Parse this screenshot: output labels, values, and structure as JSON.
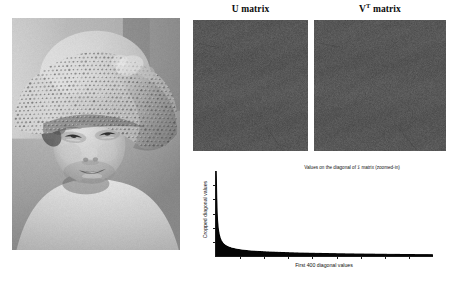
{
  "figure": {
    "caption_absent": true,
    "background_color": "#ffffff"
  },
  "photo": {
    "name": "original-grayscale-photo",
    "description": "Grayscale photograph of a young smiling child wearing a wide-brimmed crochet straw hat",
    "colorspace": "grayscale",
    "frame_color": "#ffffff"
  },
  "panels": {
    "u_matrix": {
      "title": "U matrix",
      "title_plain": "U matrix",
      "fill_description": "uniform gray noise",
      "mean_gray": "#565656",
      "noise_amplitude": 14
    },
    "vt_matrix": {
      "title_base": "V",
      "title_superscript": "T",
      "title_suffix": " matrix",
      "title_plain": "V^T matrix",
      "fill_description": "uniform gray noise",
      "mean_gray": "#565656",
      "noise_amplitude": 14
    }
  },
  "chart_data": {
    "type": "area",
    "title": "Values on the diagonal of Σ matrix (zoomed-in)",
    "xlabel": "First 400 diagonal values",
    "ylabel": "Cropped diagonal values",
    "grid": false,
    "legend": null,
    "fill_color": "#050505",
    "line_color": "#000000",
    "axis_color": "#1a1a1a",
    "xlim": [
      0,
      400
    ],
    "ylim": [
      0,
      1
    ],
    "x_tick_count": 8,
    "y_tick_count": 5,
    "x_tick_labels": [],
    "y_tick_labels": [],
    "x": [
      1,
      2,
      3,
      4,
      5,
      6,
      8,
      10,
      12,
      15,
      20,
      25,
      30,
      40,
      50,
      60,
      80,
      100,
      125,
      150,
      175,
      200,
      225,
      250,
      275,
      300,
      325,
      350,
      375,
      400
    ],
    "values": [
      1.0,
      0.62,
      0.45,
      0.36,
      0.305,
      0.265,
      0.215,
      0.183,
      0.162,
      0.14,
      0.118,
      0.104,
      0.094,
      0.08,
      0.071,
      0.064,
      0.055,
      0.049,
      0.043,
      0.0385,
      0.0348,
      0.0318,
      0.0292,
      0.027,
      0.025,
      0.0232,
      0.0216,
      0.0202,
      0.0189,
      0.0178
    ]
  }
}
